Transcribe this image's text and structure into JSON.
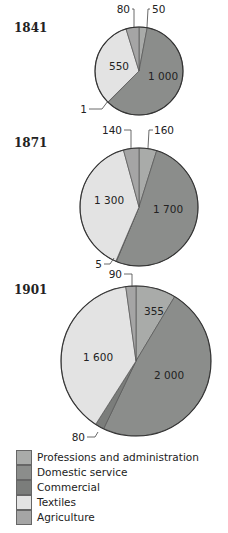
{
  "chart_data": {
    "type": "pie",
    "title": "",
    "categories": [
      "Professions and administration",
      "Domestic service",
      "Commercial",
      "Textiles",
      "Agriculture"
    ],
    "colors": [
      "#a9aba9",
      "#8b8d8b",
      "#7b7d7b",
      "#e3e3e3",
      "#a5a5a5"
    ],
    "legend_position": "bottom-left",
    "charts": [
      {
        "year": "1841",
        "values": [
          50,
          1000,
          1,
          550,
          80
        ],
        "labels": [
          "50",
          "1 000",
          "1",
          "550",
          "80"
        ]
      },
      {
        "year": "1871",
        "values": [
          160,
          1700,
          5,
          1300,
          140
        ],
        "labels": [
          "160",
          "1 700",
          "5",
          "1 300",
          "140"
        ]
      },
      {
        "year": "1901",
        "values": [
          355,
          2000,
          80,
          1600,
          90
        ],
        "labels": [
          "355",
          "2 000",
          "80",
          "1 600",
          "90"
        ]
      }
    ]
  },
  "legend": {
    "items": [
      {
        "label": "Professions and administration",
        "color": "#a9aba9"
      },
      {
        "label": "Domestic service",
        "color": "#8b8d8b"
      },
      {
        "label": "Commercial",
        "color": "#7b7d7b"
      },
      {
        "label": "Textiles",
        "color": "#e3e3e3"
      },
      {
        "label": "Agriculture",
        "color": "#a5a5a5"
      }
    ]
  }
}
